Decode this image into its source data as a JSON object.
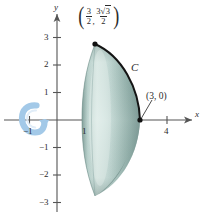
{
  "figure": {
    "background_color": "#ffffff"
  },
  "axes": {
    "x_axis_label": "x",
    "y_axis_label": "y",
    "axis_color": "#555555",
    "origin_px": [
      57,
      120
    ],
    "unit_px": 27.5,
    "x_ticks": [
      {
        "value": -1,
        "label": "−1"
      },
      {
        "value": 1,
        "label": "1"
      },
      {
        "value": 4,
        "label": "4"
      }
    ],
    "y_ticks": [
      {
        "value": 3,
        "label": "3"
      },
      {
        "value": 2,
        "label": "2"
      },
      {
        "value": 1,
        "label": "1"
      },
      {
        "value": -1,
        "label": "−1"
      },
      {
        "value": -2,
        "label": "−2"
      },
      {
        "value": -3,
        "label": "−3"
      }
    ]
  },
  "annotations": {
    "curve_label": "C",
    "point_x_intercept": "(3, 0)",
    "point_top": {
      "open_paren": "(",
      "x_numerator": "3",
      "x_denominator": "2",
      "comma": ",",
      "y_numerator_coeff": "3",
      "y_numerator_radicand": "3",
      "y_denominator": "2",
      "close_paren": ")",
      "plain_text": "(3/2, 3√3/2)"
    }
  },
  "solid": {
    "fill_light": "#d7e6e2",
    "fill_mid": "#aecac4",
    "fill_dark": "#6f8f8a",
    "outline_color": "#1c1c1c",
    "top_vertex_px": [
      95,
      44
    ],
    "right_vertex_px": [
      140,
      120
    ],
    "bottom_vertex_px": [
      95,
      196
    ]
  },
  "rotation_arrow": {
    "name": "rotation-arrow",
    "color": "#a8cce8",
    "center_px": [
      32,
      118
    ]
  }
}
